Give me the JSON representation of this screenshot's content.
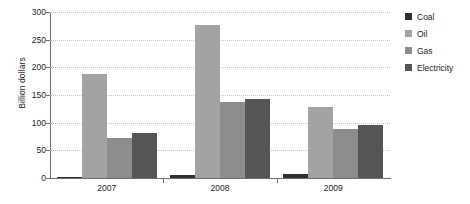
{
  "chart_data": {
    "type": "bar",
    "title": "",
    "xlabel": "",
    "ylabel": "Billion dollars",
    "categories": [
      "2007",
      "2008",
      "2009"
    ],
    "series": [
      {
        "name": "Coal",
        "color": "#2f2f2f",
        "values": [
          2,
          5,
          7
        ]
      },
      {
        "name": "Oil",
        "color": "#a3a3a3",
        "values": [
          188,
          277,
          128
        ]
      },
      {
        "name": "Gas",
        "color": "#8c8c8c",
        "values": [
          73,
          138,
          88
        ]
      },
      {
        "name": "Electricity",
        "color": "#555555",
        "values": [
          82,
          142,
          96
        ]
      }
    ],
    "ylim": [
      0,
      300
    ],
    "yticks": [
      0,
      50,
      100,
      150,
      200,
      250,
      300
    ],
    "ytick_labels": [
      "0",
      "50",
      "100",
      "150",
      "200",
      "250",
      "300"
    ],
    "grid": true,
    "legend_position": "right"
  },
  "axes": {
    "y_title": "Billion dollars"
  },
  "legend": {
    "items": [
      {
        "label": "Coal"
      },
      {
        "label": "Oil"
      },
      {
        "label": "Gas"
      },
      {
        "label": "Electricity"
      }
    ]
  }
}
